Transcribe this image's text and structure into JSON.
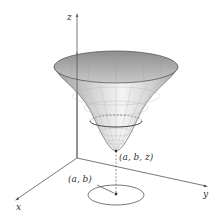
{
  "diagram": {
    "axes": {
      "x_label": "x",
      "y_label": "y",
      "z_label": "z"
    },
    "surface": {
      "type": "bowl-shaped surface (paraboloid-like)",
      "fill_light": "#f2f2f2",
      "fill_dark": "#a8a8a8",
      "edge_color": "#555555"
    },
    "labels": {
      "point_3d": "(a, b, z)",
      "point_2d": "(a, b)"
    },
    "annotations": {
      "domain_disk": "ellipse in xy-plane around (a, b)",
      "projection_line": "dashed vertical line from (a, b) up to (a, b, z)"
    }
  }
}
